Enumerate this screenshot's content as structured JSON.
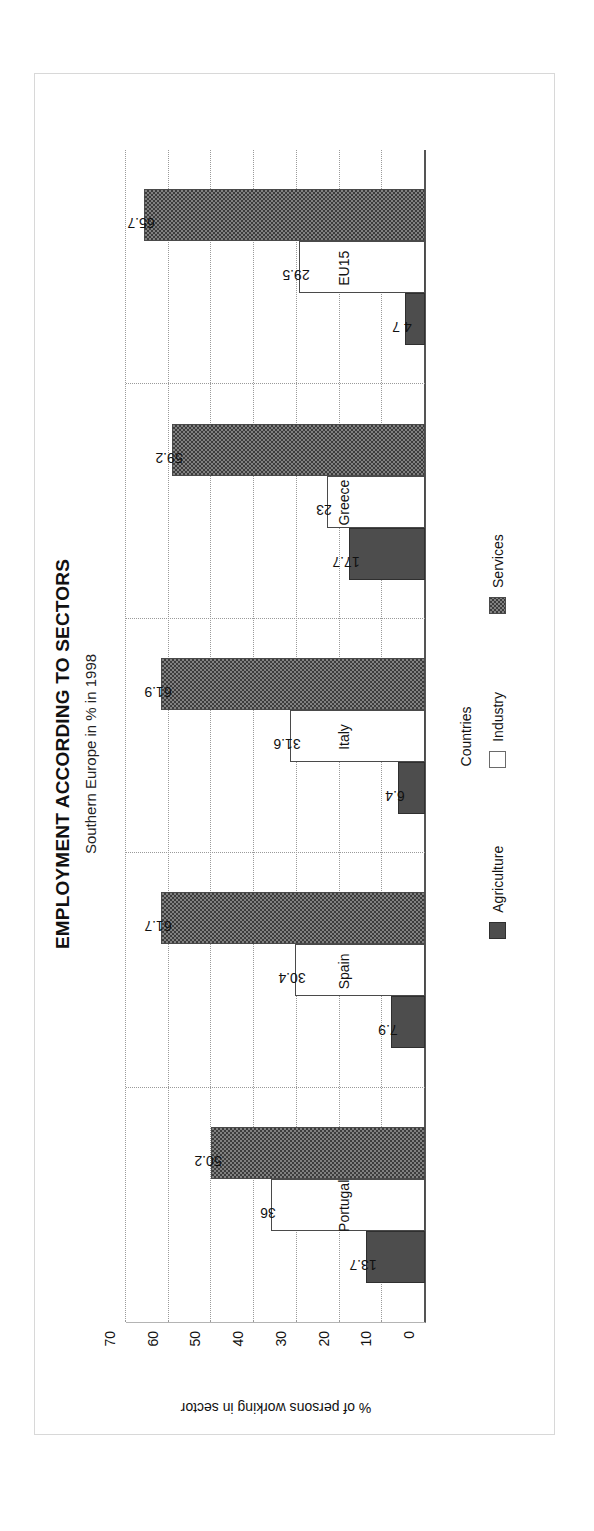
{
  "chart_data": {
    "type": "bar",
    "orientation": "vertical-rotated",
    "title": "EMPLOYMENT ACCORDING TO SECTORS",
    "subtitle": "Southern Europe in % in 1998",
    "xlabel": "Countries",
    "ylabel": "% of persons working in sector",
    "categories": [
      "Portugal",
      "Spain",
      "Italy",
      "Greece",
      "EU15"
    ],
    "ylim": [
      0,
      70
    ],
    "yticks": [
      70,
      60,
      50,
      40,
      30,
      20,
      10,
      0
    ],
    "ytick_labels": [
      "70",
      "60",
      "50",
      "40",
      "30",
      "20",
      "10",
      "0"
    ],
    "grid": true,
    "legend_position": "bottom",
    "series": [
      {
        "name": "Agriculture",
        "fill": "solid-dark",
        "color": "#4d4d4d",
        "values": [
          13.7,
          7.9,
          6.4,
          17.7,
          4.7
        ],
        "labels": [
          "13.7",
          "7.9",
          "6.4",
          "17.7",
          "4 7"
        ]
      },
      {
        "name": "Industry",
        "fill": "empty-white",
        "color": "#ffffff",
        "values": [
          36,
          30.4,
          31.6,
          23,
          29.5
        ],
        "labels": [
          "36",
          "30.4",
          "31.6",
          "23",
          "29.5"
        ]
      },
      {
        "name": "Services",
        "fill": "checker-gray",
        "color": "#808080",
        "values": [
          50.2,
          61.7,
          61.9,
          59.2,
          65.7
        ],
        "labels": [
          "50.2",
          "61.7",
          "61.9",
          "59.2",
          "65.7"
        ]
      }
    ]
  },
  "legend": {
    "items": [
      {
        "label": "Agriculture",
        "key": "agriculture"
      },
      {
        "label": "Industry",
        "key": "industry"
      },
      {
        "label": "Services",
        "key": "services"
      }
    ]
  },
  "colors": {
    "agriculture": "#4d4d4d",
    "industry": "#ffffff",
    "services": "#808080",
    "axis": "#555555",
    "grid": "#9a9a9a",
    "frame": "#d8d8d8",
    "text": "#111111"
  }
}
